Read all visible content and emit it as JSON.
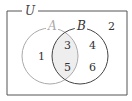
{
  "diagram": {
    "type": "venn",
    "universe_label": "U",
    "sets": [
      {
        "name": "A",
        "label": "A",
        "elements_only": [
          "1"
        ]
      },
      {
        "name": "B",
        "label": "B",
        "elements_only": [
          "4",
          "6"
        ]
      }
    ],
    "intersection": [
      "3",
      "5"
    ],
    "outside": [
      "2"
    ],
    "regions": {
      "a_only": [
        "1"
      ],
      "a_and_b": [
        "3",
        "5"
      ],
      "b_only": [
        "4",
        "6"
      ],
      "neither": [
        "2"
      ]
    },
    "colors": {
      "border": "#555555",
      "circle_a": "#aaaaaa",
      "circle_b": "#444444",
      "intersection_fill": "#eeeeee",
      "label_a": "#aaaaaa",
      "label_b": "#333333",
      "label_u": "#444444"
    }
  }
}
